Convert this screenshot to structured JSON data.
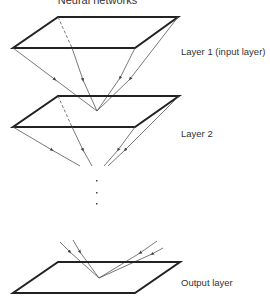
{
  "diagram": {
    "title": "Neural networks",
    "layers": [
      {
        "label": "Layer 1 (input layer)",
        "label_y": 46
      },
      {
        "label": "Layer 2",
        "label_y": 128
      },
      {
        "label": "Output layer",
        "label_y": 277
      }
    ],
    "ellipsis_dots": 3,
    "colors": {
      "plane": "#222222",
      "arrow": "#555555",
      "text": "#333333"
    }
  }
}
